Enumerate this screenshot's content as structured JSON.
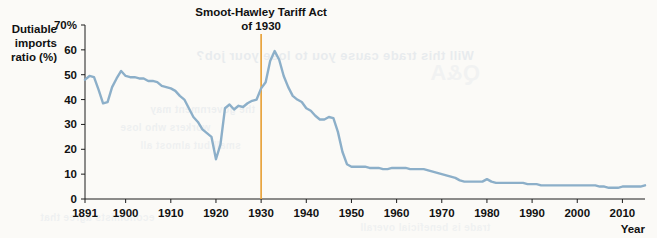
{
  "figure": {
    "background_color": "#fbfaf7"
  },
  "bleed_text": {
    "line1": "Will this trade cause you to lose your job?",
    "line2": "the government may",
    "line3": "workers who lose",
    "line4": "small but almost all",
    "line5": "economists agree that",
    "line6": "trade is beneficial overall",
    "line7": "Q&A"
  },
  "chart_data": {
    "type": "line",
    "title": "",
    "xlabel": "Year",
    "ylabel": "Dutiable imports ratio (%)",
    "ylabel_lines": [
      "Dutiable",
      "imports",
      "ratio (%)"
    ],
    "xlim": [
      1891,
      2015
    ],
    "ylim": [
      0,
      70
    ],
    "grid": false,
    "legend": "none",
    "y_ticks": [
      0,
      10,
      20,
      30,
      40,
      50,
      60,
      70
    ],
    "y_tick_labels": [
      "0",
      "10",
      "20",
      "30",
      "40",
      "50",
      "60",
      "70%"
    ],
    "x_ticks": [
      1891,
      1900,
      1910,
      1920,
      1930,
      1940,
      1950,
      1960,
      1970,
      1980,
      1990,
      2000,
      2010
    ],
    "x_tick_labels": [
      "1891",
      "1900",
      "1910",
      "1920",
      "1930",
      "1940",
      "1950",
      "1960",
      "1970",
      "1980",
      "1990",
      "2000",
      "2010"
    ],
    "series": [
      {
        "name": "Dutiable imports ratio",
        "color": "#8CAFC9",
        "x": [
          1891,
          1892,
          1893,
          1894,
          1895,
          1896,
          1897,
          1898,
          1899,
          1900,
          1901,
          1902,
          1903,
          1904,
          1905,
          1906,
          1907,
          1908,
          1909,
          1910,
          1911,
          1912,
          1913,
          1914,
          1915,
          1916,
          1917,
          1918,
          1919,
          1920,
          1921,
          1922,
          1923,
          1924,
          1925,
          1926,
          1927,
          1928,
          1929,
          1930,
          1931,
          1932,
          1933,
          1934,
          1935,
          1936,
          1937,
          1938,
          1939,
          1940,
          1941,
          1942,
          1943,
          1944,
          1945,
          1946,
          1947,
          1948,
          1949,
          1950,
          1951,
          1952,
          1953,
          1954,
          1955,
          1956,
          1957,
          1958,
          1959,
          1960,
          1961,
          1962,
          1963,
          1964,
          1965,
          1966,
          1967,
          1968,
          1969,
          1970,
          1971,
          1972,
          1973,
          1974,
          1975,
          1976,
          1977,
          1978,
          1979,
          1980,
          1981,
          1982,
          1983,
          1984,
          1985,
          1986,
          1987,
          1988,
          1989,
          1990,
          1991,
          1992,
          1993,
          1994,
          1995,
          1996,
          1997,
          1998,
          1999,
          2000,
          2001,
          2002,
          2003,
          2004,
          2005,
          2006,
          2007,
          2008,
          2009,
          2010,
          2011,
          2012,
          2013,
          2014,
          2015
        ],
        "y": [
          48.0,
          49.5,
          49.0,
          44.0,
          38.5,
          39.0,
          45.0,
          48.5,
          51.5,
          49.5,
          49.0,
          49.0,
          48.5,
          48.5,
          47.5,
          47.5,
          47.0,
          45.5,
          45.0,
          44.5,
          43.5,
          41.5,
          40.0,
          36.5,
          33.0,
          31.0,
          28.0,
          26.5,
          25.0,
          16.0,
          22.0,
          36.5,
          38.0,
          36.0,
          37.5,
          37.0,
          38.5,
          39.5,
          40.0,
          44.5,
          47.0,
          55.5,
          59.5,
          56.0,
          49.5,
          45.0,
          41.5,
          40.0,
          39.0,
          36.5,
          35.5,
          33.5,
          32.0,
          32.0,
          33.0,
          32.5,
          27.0,
          19.0,
          14.0,
          13.0,
          13.0,
          13.0,
          13.0,
          12.5,
          12.5,
          12.5,
          12.0,
          12.0,
          12.5,
          12.5,
          12.5,
          12.5,
          12.0,
          12.0,
          12.0,
          12.0,
          11.5,
          11.0,
          10.5,
          10.0,
          9.5,
          9.0,
          8.5,
          7.5,
          7.0,
          7.0,
          7.0,
          7.0,
          7.0,
          8.0,
          7.0,
          6.5,
          6.5,
          6.5,
          6.5,
          6.5,
          6.5,
          6.5,
          6.0,
          6.0,
          6.0,
          5.5,
          5.5,
          5.5,
          5.5,
          5.5,
          5.5,
          5.5,
          5.5,
          5.5,
          5.5,
          5.5,
          5.5,
          5.5,
          5.0,
          5.0,
          4.5,
          4.5,
          4.5,
          5.0,
          5.0,
          5.0,
          5.0,
          5.0,
          5.5
        ]
      }
    ],
    "annotations": [
      {
        "name": "smoot-hawley-marker",
        "text_lines": [
          "Smoot-Hawley Tariff Act",
          "of 1930"
        ],
        "x": 1930,
        "color": "#E8A33D"
      }
    ]
  }
}
